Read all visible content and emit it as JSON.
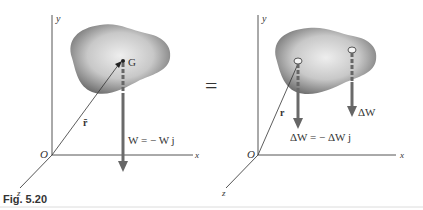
{
  "figure": {
    "caption": "Fig. 5.20",
    "left": {
      "axis_y": "y",
      "axis_x": "x",
      "axis_z": "z",
      "origin": "O",
      "point": "G",
      "position_vector": "r̄",
      "force_label": "W = − W j"
    },
    "equals": "=",
    "right": {
      "axis_y": "y",
      "axis_x": "x",
      "axis_z": "z",
      "origin": "O",
      "position_vector": "r",
      "force_label_1": "ΔW = − ΔW j",
      "force_label_2": "ΔW"
    },
    "colors": {
      "arrow": "#6a6a6a",
      "body_light": "#e8e8e8",
      "body_dark": "#6e6e6e",
      "axis": "#555555"
    }
  }
}
